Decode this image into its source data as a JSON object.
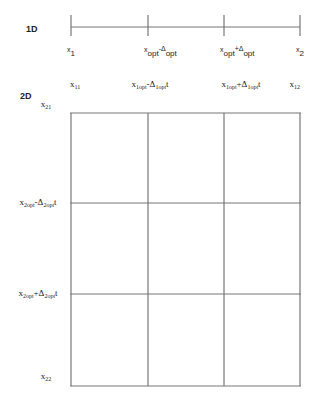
{
  "diagram": {
    "row_1d": {
      "label": "1D",
      "ticks": [
        {
          "base": "x",
          "sub": "1",
          "op": "",
          "dsub": ""
        },
        {
          "base": "x",
          "sub": "opt",
          "op": "-",
          "dsub": "opt"
        },
        {
          "base": "x",
          "sub": "opt",
          "op": "+",
          "dsub": "opt"
        },
        {
          "base": "x",
          "sub": "2",
          "op": "",
          "dsub": ""
        }
      ]
    },
    "row_2d": {
      "label": "2D",
      "top_labels": [
        {
          "base": "x",
          "sub": "11",
          "op": "",
          "dsub": ""
        },
        {
          "base": "x",
          "sub": "1opt",
          "op": "-",
          "dsub": "1opt",
          "tail": "t"
        },
        {
          "base": "x",
          "sub": "1opt",
          "op": "+",
          "dsub": "1opt",
          "tail": "t"
        },
        {
          "base": "x",
          "sub": "12",
          "op": "",
          "dsub": ""
        }
      ],
      "left_labels": [
        {
          "base": "x",
          "sub": "21",
          "op": "",
          "dsub": ""
        },
        {
          "base": "x",
          "sub": "2opt",
          "op": "-",
          "dsub": "2opt",
          "tail": "t"
        },
        {
          "base": "x",
          "sub": "2opt",
          "op": "+",
          "dsub": "2opt",
          "tail": "t"
        },
        {
          "base": "x",
          "sub": "22",
          "op": "",
          "dsub": ""
        }
      ],
      "grid": {
        "rows": 3,
        "cols": 3
      }
    }
  }
}
